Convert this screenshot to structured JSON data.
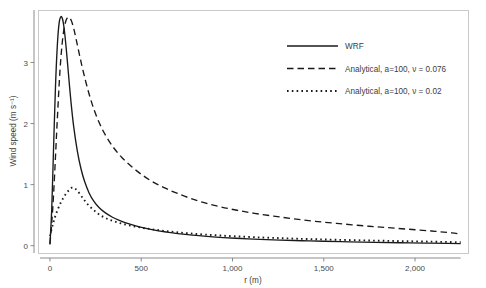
{
  "chart_data": {
    "type": "line",
    "title": "",
    "xlabel": "r (m)",
    "ylabel": "Wind speed (m s⁻¹)",
    "xlim": [
      -60,
      2290
    ],
    "ylim": [
      -0.12,
      3.86
    ],
    "grid": false,
    "legend_position": "top-right-inside",
    "xticks": [
      0,
      500,
      1000,
      1500,
      2000
    ],
    "xticklabels": [
      "0",
      "500",
      "1,000",
      "1,500",
      "2,000"
    ],
    "yticks": [
      0,
      1,
      2,
      3
    ],
    "yticklabels": [
      "0",
      "1",
      "2",
      "3"
    ],
    "series": [
      {
        "name": "WRF",
        "style": "solid",
        "color": "#1a1a1a",
        "x": [
          0,
          10,
          20,
          30,
          40,
          50,
          60,
          70,
          80,
          90,
          100,
          115,
          130,
          150,
          170,
          190,
          215,
          240,
          270,
          300,
          340,
          380,
          420,
          470,
          520,
          580,
          640,
          700,
          780,
          860,
          950,
          1050,
          1150,
          1260,
          1380,
          1500,
          1640,
          1780,
          1920,
          2060,
          2180,
          2250
        ],
        "y": [
          0.02,
          0.62,
          1.62,
          2.58,
          3.26,
          3.64,
          3.75,
          3.7,
          3.5,
          3.2,
          2.86,
          2.36,
          1.95,
          1.55,
          1.26,
          1.05,
          0.86,
          0.73,
          0.62,
          0.545,
          0.47,
          0.415,
          0.37,
          0.325,
          0.287,
          0.25,
          0.222,
          0.198,
          0.172,
          0.152,
          0.133,
          0.117,
          0.104,
          0.092,
          0.081,
          0.072,
          0.063,
          0.055,
          0.048,
          0.042,
          0.037,
          0.034
        ]
      },
      {
        "name": "Analytical, a=100, ν = 0.076",
        "style": "dashed",
        "color": "#1a1a1a",
        "x": [
          0,
          10,
          20,
          30,
          40,
          55,
          70,
          85,
          100,
          115,
          130,
          145,
          165,
          185,
          210,
          240,
          275,
          310,
          350,
          395,
          445,
          500,
          560,
          625,
          695,
          770,
          850,
          935,
          1025,
          1120,
          1225,
          1335,
          1450,
          1570,
          1700,
          1830,
          1960,
          2090,
          2200,
          2250
        ],
        "y": [
          0.03,
          0.38,
          0.85,
          1.44,
          2.05,
          2.87,
          3.4,
          3.66,
          3.74,
          3.7,
          3.56,
          3.36,
          3.08,
          2.82,
          2.53,
          2.24,
          1.98,
          1.78,
          1.6,
          1.44,
          1.3,
          1.17,
          1.05,
          0.95,
          0.86,
          0.775,
          0.7,
          0.635,
          0.58,
          0.53,
          0.485,
          0.44,
          0.4,
          0.365,
          0.33,
          0.3,
          0.27,
          0.24,
          0.21,
          0.19
        ]
      },
      {
        "name": "Analytical, a=100, ν = 0.02",
        "style": "dotted",
        "color": "#1a1a1a",
        "x": [
          0,
          10,
          20,
          30,
          45,
          60,
          75,
          90,
          105,
          120,
          135,
          150,
          170,
          190,
          215,
          245,
          275,
          310,
          350,
          395,
          445,
          500,
          560,
          625,
          695,
          770,
          850,
          935,
          1025,
          1120,
          1225,
          1335,
          1450,
          1570,
          1700,
          1830,
          1960,
          2090,
          2200,
          2250
        ],
        "y": [
          0.16,
          0.28,
          0.39,
          0.49,
          0.61,
          0.71,
          0.79,
          0.86,
          0.91,
          0.95,
          0.94,
          0.9,
          0.82,
          0.74,
          0.65,
          0.57,
          0.5,
          0.445,
          0.4,
          0.36,
          0.325,
          0.295,
          0.268,
          0.243,
          0.22,
          0.2,
          0.182,
          0.166,
          0.152,
          0.139,
          0.127,
          0.116,
          0.106,
          0.097,
          0.088,
          0.08,
          0.073,
          0.066,
          0.06,
          0.057
        ]
      }
    ],
    "legend": [
      {
        "label": "WRF",
        "style": "solid"
      },
      {
        "label": "Analytical, a=100, ν = 0.076",
        "style": "dashed"
      },
      {
        "label": "Analytical, a=100, ν = 0.02",
        "style": "dotted"
      }
    ]
  },
  "axes": {
    "x_title": "r (m)",
    "y_title": "Wind speed (m s⁻¹)"
  },
  "colors": {
    "line": "#1a1a1a",
    "panel_border": "#c9c9c9",
    "axis": "#6e6e6e",
    "text": "#3d3d3d",
    "background": "#ffffff"
  }
}
